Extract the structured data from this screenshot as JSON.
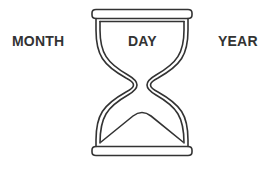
{
  "labels": {
    "left": "MONTH",
    "center": "DAY",
    "right": "YEAR"
  },
  "icon": "hourglass-icon",
  "colors": {
    "stroke": "#333333",
    "text": "#333333",
    "background": "#ffffff"
  }
}
